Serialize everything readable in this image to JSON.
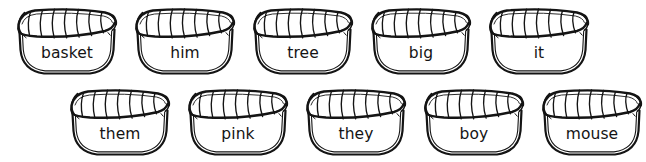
{
  "worksheet": {
    "title": "Word Baskets",
    "background_color": "#ffffff",
    "ink_color": "#141414",
    "basket_icon_name": "woven-basket",
    "rows": [
      {
        "row_name": "top-row",
        "baskets": [
          {
            "word": "basket"
          },
          {
            "word": "him"
          },
          {
            "word": "tree"
          },
          {
            "word": "big"
          },
          {
            "word": "it"
          }
        ]
      },
      {
        "row_name": "bottom-row",
        "baskets": [
          {
            "word": "them"
          },
          {
            "word": "pink"
          },
          {
            "word": "they"
          },
          {
            "word": "boy"
          },
          {
            "word": "mouse"
          }
        ]
      }
    ]
  }
}
